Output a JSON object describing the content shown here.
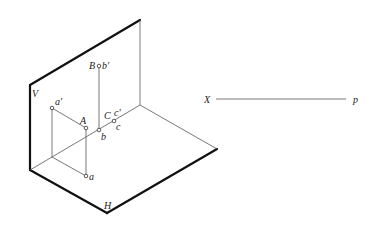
{
  "diagram": {
    "title": "",
    "planes": {
      "vertical": "V",
      "horizontal": "H"
    },
    "points": [
      {
        "name": "A",
        "space_label": "A",
        "v_projection": "a'",
        "h_projection": "a"
      },
      {
        "name": "B",
        "space_label": "B",
        "v_projection": "b'",
        "h_projection": "b"
      },
      {
        "name": "C",
        "space_label": "C",
        "v_projection": "c'",
        "h_projection": "c"
      }
    ],
    "axis": {
      "start_label": "X",
      "end_label": "p"
    }
  }
}
